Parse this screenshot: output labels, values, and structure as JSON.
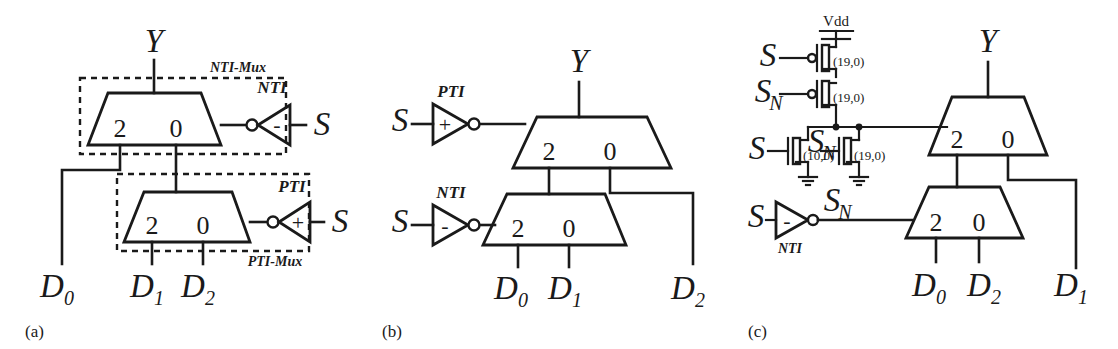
{
  "figure": {
    "caption_labels": [
      "(a)",
      "(b)",
      "(c)"
    ],
    "background_color": "#ffffff",
    "ink_color": "#1a1a1a"
  },
  "panels": [
    {
      "id": "a",
      "label": "(a)",
      "description": "Two cascaded 2-to-1 multiplexers with NTI and PTI select inverters, each grouped in a dashed box",
      "output_label": "Y",
      "dashed_groups": [
        {
          "name": "NTI-Mux",
          "label": "NTI-Mux"
        },
        {
          "name": "PTI-Mux",
          "label": "PTI-Mux"
        }
      ],
      "muxes": [
        {
          "name": "top-mux",
          "port_labels": [
            "2",
            "0"
          ],
          "select_inverter": "NTI"
        },
        {
          "name": "bottom-mux",
          "port_labels": [
            "2",
            "0"
          ],
          "select_inverter": "PTI"
        }
      ],
      "inverters": [
        {
          "name": "NTI",
          "label": "NTI",
          "sign": "-",
          "input_label": "S"
        },
        {
          "name": "PTI",
          "label": "PTI",
          "sign": "+",
          "input_label": "S"
        }
      ],
      "data_inputs": [
        {
          "label_base": "D",
          "sub": "0"
        },
        {
          "label_base": "D",
          "sub": "1"
        },
        {
          "label_base": "D",
          "sub": "2"
        }
      ],
      "select_labels": [
        "S",
        "S"
      ]
    },
    {
      "id": "b",
      "label": "(b)",
      "description": "Two cascaded 2-to-1 multiplexers driven by PTI and NTI inverters on the select inputs",
      "output_label": "Y",
      "muxes": [
        {
          "name": "top-mux",
          "port_labels": [
            "2",
            "0"
          ],
          "select_inverter": "PTI"
        },
        {
          "name": "bottom-mux",
          "port_labels": [
            "2",
            "0"
          ],
          "select_inverter": "NTI"
        }
      ],
      "inverters": [
        {
          "name": "PTI",
          "label": "PTI",
          "sign": "+",
          "input_label": "S"
        },
        {
          "name": "NTI",
          "label": "NTI",
          "sign": "-",
          "input_label": "S"
        }
      ],
      "data_inputs": [
        {
          "label_base": "D",
          "sub": "0"
        },
        {
          "label_base": "D",
          "sub": "1"
        },
        {
          "label_base": "D",
          "sub": "2"
        }
      ]
    },
    {
      "id": "c",
      "label": "(c)",
      "description": "Transistor-level select generator feeding two cascaded multiplexers, with an NTI inverter producing S_N",
      "output_label": "Y",
      "supply_label": "Vdd",
      "transistors": [
        {
          "name": "pmos-top",
          "type": "pmos",
          "gate_input": "S",
          "size_label": "(19,0)"
        },
        {
          "name": "pmos-bottom",
          "type": "pmos",
          "gate_input": "S_N",
          "size_label": "(19,0)"
        },
        {
          "name": "nmos-left",
          "type": "nmos",
          "gate_input": "S",
          "size_label": "(10,0)"
        },
        {
          "name": "nmos-right",
          "type": "nmos",
          "gate_input": "S_N",
          "size_label": "(19,0)"
        }
      ],
      "gate_signal_labels": [
        {
          "base": "S",
          "sub": ""
        },
        {
          "base": "S",
          "sub": "N"
        },
        {
          "base": "S",
          "sub": ""
        },
        {
          "base": "S",
          "sub": "N"
        }
      ],
      "node_label": {
        "base": "S",
        "sub": "N"
      },
      "inverters": [
        {
          "name": "NTI",
          "label": "NTI",
          "sign": "-",
          "input_label": "S",
          "output_label_base": "S",
          "output_label_sub": "N"
        }
      ],
      "muxes": [
        {
          "name": "top-mux",
          "port_labels": [
            "2",
            "0"
          ]
        },
        {
          "name": "bottom-mux",
          "port_labels": [
            "2",
            "0"
          ]
        }
      ],
      "data_inputs": [
        {
          "label_base": "D",
          "sub": "0"
        },
        {
          "label_base": "D",
          "sub": "2"
        },
        {
          "label_base": "D",
          "sub": "1"
        }
      ]
    }
  ]
}
